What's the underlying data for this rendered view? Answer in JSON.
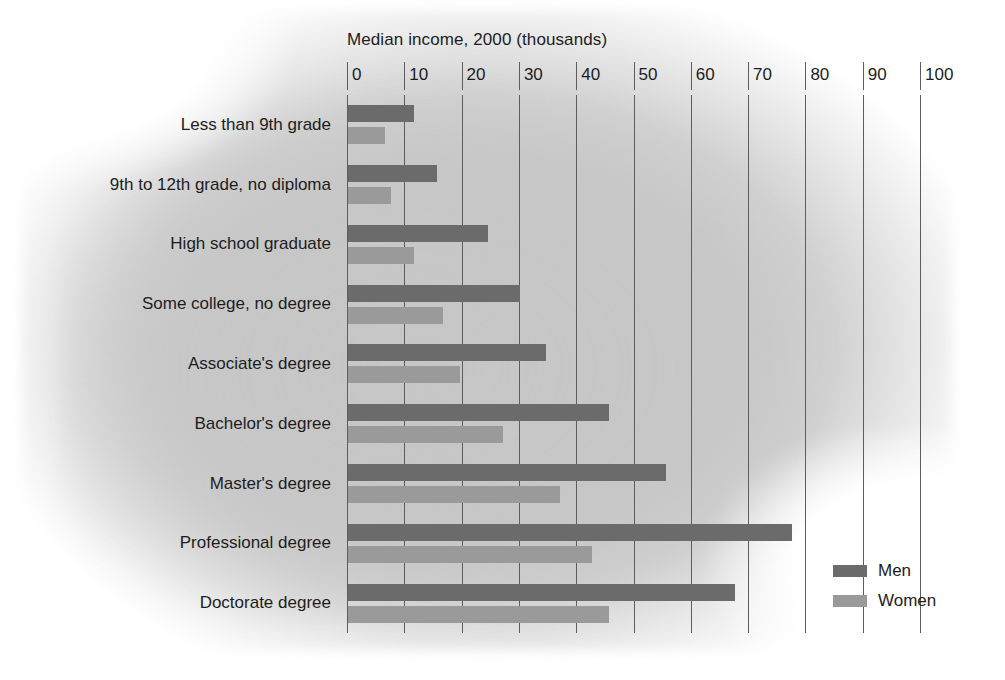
{
  "chart_data": {
    "type": "bar",
    "orientation": "horizontal",
    "title": "Median income, 2000 (thousands)",
    "xlabel": "",
    "ylabel": "",
    "xlim": [
      0,
      100
    ],
    "xticks": [
      0,
      10,
      20,
      30,
      40,
      50,
      60,
      70,
      80,
      90,
      100
    ],
    "xtick_labels": [
      "0",
      "10",
      "20",
      "30",
      "40",
      "50",
      "60",
      "70",
      "80",
      "90",
      "100"
    ],
    "grid": "vertical",
    "legend_position": "bottom-right",
    "categories": [
      "Less than 9th grade",
      "9th to 12th grade, no diploma",
      "High school graduate",
      "Some college, no degree",
      "Associate's degree",
      "Bachelor's degree",
      "Master's degree",
      "Professional degree",
      "Doctorate degree"
    ],
    "series": [
      {
        "name": "Men",
        "color": "#6b6b6b",
        "values": [
          11.5,
          15.5,
          24.5,
          30,
          34.5,
          45.5,
          55.5,
          77.5,
          67.5
        ]
      },
      {
        "name": "Women",
        "color": "#9a9a9a",
        "values": [
          6.5,
          7.5,
          11.5,
          16.5,
          19.5,
          27,
          37,
          42.5,
          45.5
        ]
      }
    ]
  },
  "legend": {
    "items": [
      {
        "label": "Men",
        "color": "#6b6b6b"
      },
      {
        "label": "Women",
        "color": "#9a9a9a"
      }
    ]
  }
}
